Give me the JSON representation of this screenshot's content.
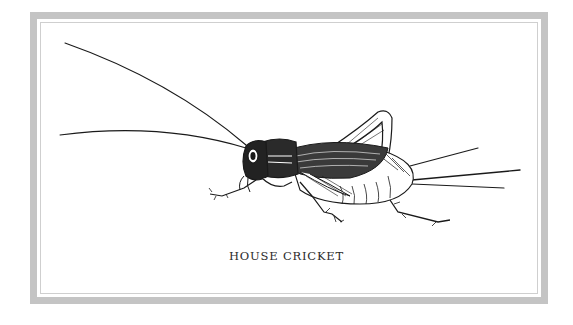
{
  "card": {
    "caption": "HOUSE CRICKET",
    "frame_color": "#c4c4c4",
    "ink_color": "#1a1a1a"
  },
  "illustration": {
    "subject": "house-cricket",
    "style": "pen-and-ink engraving"
  }
}
